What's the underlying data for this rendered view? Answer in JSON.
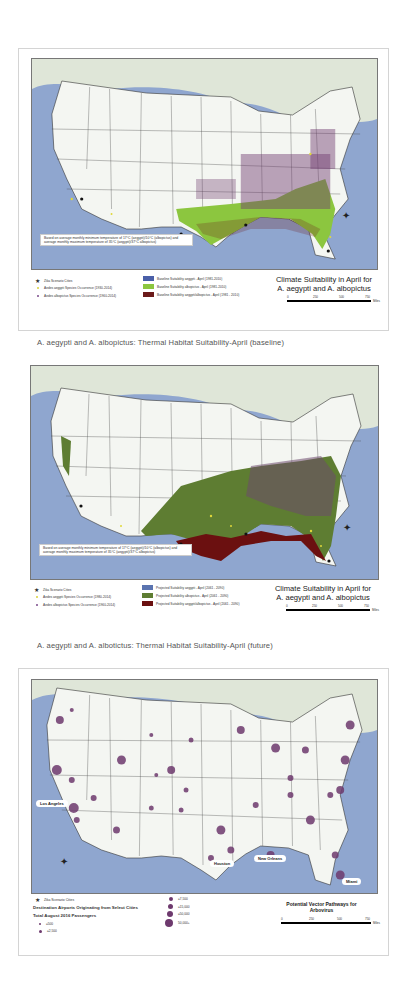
{
  "panels": [
    {
      "id": "baseline",
      "map_title_line1": "Climate Suitability in April for",
      "map_title_line2": "A. aegypti and A. albopictus",
      "note": "Based on average monthly minimum temperature of 17°C (aegypti)/10°C (albopictus) and average monthly maximum temperature of 35°C (aegypti)/37°C albopictus)",
      "legend_points": [
        {
          "label": "Zika Scenario Cities",
          "symbol": "star",
          "color": "#111111"
        },
        {
          "label": "Aedes aegypti Species Occurrence (1930-2014)",
          "symbol": "dot",
          "color": "#d8d23a"
        },
        {
          "label": "Aedes albopictus Species Occurrence (1960-2014)",
          "symbol": "dot",
          "color": "#7a4a8a"
        }
      ],
      "legend_areas": [
        {
          "label": "Baseline Suitability aegypti - April (1981-2010)",
          "color": "#4a5fa8"
        },
        {
          "label": "Baseline Suitability albopictus - April (1981-2010)",
          "color": "#8cc63f"
        },
        {
          "label": "Baseline Suitability aegypti/albopictus - April (1981 - 2010)",
          "color": "#6b1a1a"
        }
      ],
      "scale": {
        "ticks": [
          "0",
          "250",
          "500",
          "750"
        ],
        "unit": "Miles"
      },
      "caption": "A. aegypti and A. albopictus: Thermal Habitat Suitability-April (baseline)"
    },
    {
      "id": "future",
      "map_title_line1": "Climate Suitability in April for",
      "map_title_line2": "A. aegypti and A. albopictus",
      "note": "Based on average monthly minimum temperature of 17°C (aegypti)/10°C (albopictus) and average monthly maximum temperature of 35°C (aegypti)/37°C albopictus)",
      "legend_points": [
        {
          "label": "Zika Scenario Cities",
          "symbol": "star",
          "color": "#111111"
        },
        {
          "label": "Aedes aegypti Species Occurrence (1980-2014)",
          "symbol": "dot",
          "color": "#d8d23a"
        },
        {
          "label": "Aedes albopictus Species Occurrence (1960-2014)",
          "symbol": "dot",
          "color": "#7a4a8a"
        }
      ],
      "legend_areas": [
        {
          "label": "Projected Suitability aegypti - April (2061 - 2090)",
          "color": "#5b74b0"
        },
        {
          "label": "Projected Suitability albopictus - April (2061 - 2090)",
          "color": "#5e7d32"
        },
        {
          "label": "Projected Suitability aegypti/albopictus - April (2061 - 2090)",
          "color": "#6b1010"
        }
      ],
      "scale": {
        "ticks": [
          "0",
          "250",
          "500",
          "750"
        ],
        "unit": "Miles"
      },
      "caption": "A. aegypti and A. albotictus: Thermal Habitat Suitability-April (future)"
    },
    {
      "id": "pathways",
      "map_title_line1": "Potential Vector Pathways for",
      "map_title_line2": "Arbovirus",
      "legend_star": "Zika Scenario Cities",
      "legend_heading1": "Destination Airports Originating from Select Cities",
      "legend_heading2": "Total August 2016 Passengers",
      "passenger_classes": [
        "≤500",
        "≤2,500",
        "≤7,500",
        "≤15,000",
        "≤50,000",
        "50,000+"
      ],
      "city_labels": [
        "Los Angeles",
        "Houston",
        "New Orleans",
        "Miami"
      ],
      "scale": {
        "ticks": [
          "0",
          "250",
          "500",
          "750"
        ],
        "unit": "Miles"
      }
    }
  ],
  "colors": {
    "ocean": "#8fa6cf",
    "land": "#f4f6f2",
    "canada": "#dfe6d8",
    "purple_dot": "#6e3a6e"
  }
}
